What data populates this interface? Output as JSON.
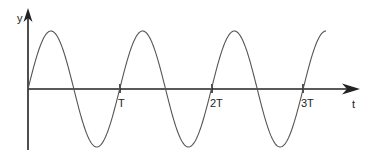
{
  "chart_data": {
    "type": "line",
    "title": "",
    "xlabel": "t",
    "ylabel": "y",
    "function": "y = sin(2π t / T)",
    "x_ticks": [
      "T",
      "2T",
      "3T"
    ],
    "x_tick_values": [
      1,
      2,
      3
    ],
    "x_range": [
      0,
      3.25
    ],
    "y_range": [
      -1,
      1
    ],
    "grid": false,
    "legend": null,
    "series": [
      {
        "name": "y(t)",
        "x": [
          0,
          0.25,
          0.5,
          0.75,
          1,
          1.25,
          1.5,
          1.75,
          2,
          2.25,
          2.5,
          2.75,
          3,
          3.25
        ],
        "values": [
          0,
          1,
          0,
          -1,
          0,
          1,
          0,
          -1,
          0,
          1,
          0,
          -1,
          0,
          1
        ]
      }
    ]
  },
  "labels": {
    "y_axis": "y",
    "x_axis": "t",
    "tick_T": "T",
    "tick_2T": "2T",
    "tick_3T": "3T"
  },
  "colors": {
    "axis": "#222222",
    "curve": "#555555"
  }
}
